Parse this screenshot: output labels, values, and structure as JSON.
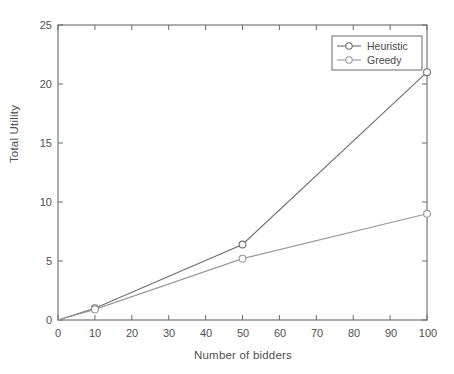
{
  "chart_data": {
    "type": "line",
    "title": "",
    "xlabel": "Number of bidders",
    "ylabel": "Total Utility",
    "xlim": [
      0,
      100
    ],
    "ylim": [
      0,
      25
    ],
    "xticks": [
      0,
      10,
      20,
      30,
      40,
      50,
      60,
      70,
      80,
      90,
      100
    ],
    "yticks": [
      0,
      5,
      10,
      15,
      20,
      25
    ],
    "xtick_labels": [
      "0",
      "10",
      "20",
      "30",
      "40",
      "50",
      "60",
      "70",
      "80",
      "90",
      "100"
    ],
    "ytick_labels": [
      "0",
      "5",
      "10",
      "15",
      "20",
      "25"
    ],
    "grid": false,
    "legend_position": "upper right",
    "marker": "circle-open",
    "series": [
      {
        "name": "Heuristic",
        "color": "#6e6e6e",
        "x": [
          0,
          10,
          50,
          100
        ],
        "values": [
          0,
          1.0,
          6.4,
          21.0
        ]
      },
      {
        "name": "Greedy",
        "color": "#9a9a9a",
        "x": [
          0,
          10,
          50,
          100
        ],
        "values": [
          0,
          0.9,
          5.2,
          9.0
        ]
      }
    ]
  },
  "legend": {
    "entries": [
      {
        "label": "Heuristic"
      },
      {
        "label": "Greedy"
      }
    ]
  },
  "axes": {
    "frame_color": "#6a6a6a",
    "background": "#ffffff"
  }
}
